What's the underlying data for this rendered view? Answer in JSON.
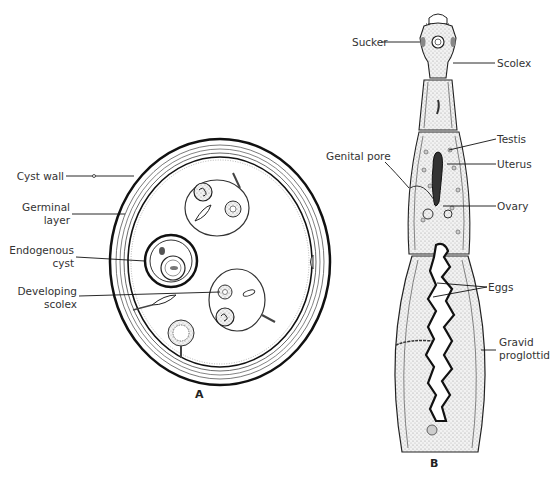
{
  "panels": {
    "a": {
      "letter": "A",
      "labels": {
        "cyst_wall": "Cyst wall",
        "germinal_layer_1": "Germinal",
        "germinal_layer_2": "layer",
        "endogenous_cyst_1": "Endogenous",
        "endogenous_cyst_2": "cyst",
        "developing_scolex_1": "Developing",
        "developing_scolex_2": "scolex"
      }
    },
    "b": {
      "letter": "B",
      "labels": {
        "sucker": "Sucker",
        "scolex": "Scolex",
        "testis": "Testis",
        "genital_pore": "Genital pore",
        "uterus": "Uterus",
        "ovary": "Ovary",
        "eggs": "Eggs",
        "gravid_proglottid_1": "Gravid",
        "gravid_proglottid_2": "proglottid"
      }
    }
  },
  "colors": {
    "ink": "#1a1a1a",
    "stipple": "#d8d8d8",
    "paper": "#ffffff"
  }
}
